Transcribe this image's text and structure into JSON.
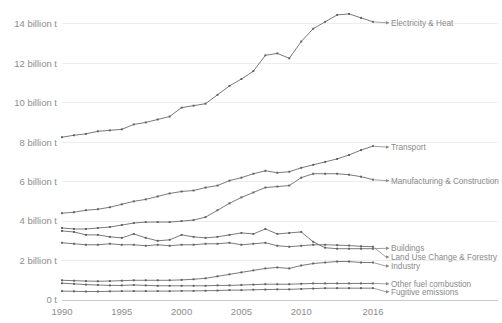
{
  "chart_data": {
    "type": "line",
    "title": "",
    "subtitle": "",
    "xlabel": "",
    "ylabel": "",
    "xlim": [
      1990,
      2016
    ],
    "ylim": [
      0,
      14.8
    ],
    "grid": true,
    "legend_position": "right-inline-labels",
    "x": [
      1990,
      1991,
      1992,
      1993,
      1994,
      1995,
      1996,
      1997,
      1998,
      1999,
      2000,
      2001,
      2002,
      2003,
      2004,
      2005,
      2006,
      2007,
      2008,
      2009,
      2010,
      2011,
      2012,
      2013,
      2014,
      2015,
      2016
    ],
    "xtick_labels": [
      "1990",
      "1995",
      "2000",
      "2005",
      "2010",
      "2016"
    ],
    "xtick_values": [
      1990,
      1995,
      2000,
      2005,
      2010,
      2016
    ],
    "ytick_labels": [
      "0 t",
      "2 billion t",
      "4 billion t",
      "6 billion t",
      "8 billion t",
      "10 billion t",
      "12 billion t",
      "14 billion t"
    ],
    "ytick_values": [
      0,
      2,
      4,
      6,
      8,
      10,
      12,
      14
    ],
    "units": "billion tonnes CO2e",
    "series": [
      {
        "name": "Electricity & Heat",
        "values": [
          8.25,
          8.35,
          8.42,
          8.55,
          8.6,
          8.65,
          8.9,
          9.0,
          9.15,
          9.3,
          9.75,
          9.85,
          9.95,
          10.4,
          10.85,
          11.2,
          11.6,
          12.4,
          12.5,
          12.25,
          13.1,
          13.75,
          14.1,
          14.45,
          14.5,
          14.3,
          14.1
        ]
      },
      {
        "name": "Transport",
        "values": [
          4.4,
          4.45,
          4.55,
          4.6,
          4.7,
          4.85,
          5.0,
          5.1,
          5.25,
          5.4,
          5.5,
          5.55,
          5.7,
          5.8,
          6.05,
          6.2,
          6.4,
          6.55,
          6.45,
          6.5,
          6.7,
          6.85,
          7.0,
          7.15,
          7.35,
          7.6,
          7.8
        ]
      },
      {
        "name": "Manufacturing & Construction",
        "values": [
          3.65,
          3.6,
          3.6,
          3.65,
          3.7,
          3.8,
          3.9,
          3.95,
          3.95,
          3.95,
          4.0,
          4.05,
          4.2,
          4.55,
          4.9,
          5.2,
          5.45,
          5.7,
          5.75,
          5.8,
          6.2,
          6.4,
          6.4,
          6.4,
          6.35,
          6.25,
          6.1
        ]
      },
      {
        "name": "Buildings",
        "values": [
          3.5,
          3.45,
          3.3,
          3.3,
          3.2,
          3.15,
          3.35,
          3.15,
          3.0,
          3.05,
          3.3,
          3.2,
          3.15,
          3.2,
          3.3,
          3.4,
          3.35,
          3.6,
          3.35,
          3.4,
          3.45,
          2.95,
          2.65,
          2.6,
          2.6,
          2.6,
          2.6
        ]
      },
      {
        "name": "Land Use Change & Forestry",
        "values": [
          2.9,
          2.85,
          2.8,
          2.8,
          2.85,
          2.8,
          2.8,
          2.75,
          2.8,
          2.75,
          2.8,
          2.8,
          2.85,
          2.85,
          2.9,
          2.8,
          2.85,
          2.9,
          2.75,
          2.7,
          2.75,
          2.8,
          2.8,
          2.78,
          2.76,
          2.72,
          2.7
        ]
      },
      {
        "name": "Industry",
        "values": [
          1.0,
          0.98,
          0.96,
          0.95,
          0.96,
          0.98,
          1.0,
          1.0,
          1.0,
          1.0,
          1.02,
          1.05,
          1.1,
          1.2,
          1.3,
          1.4,
          1.5,
          1.6,
          1.65,
          1.6,
          1.75,
          1.85,
          1.9,
          1.95,
          1.95,
          1.9,
          1.9
        ]
      },
      {
        "name": "Other fuel combustion",
        "values": [
          0.85,
          0.82,
          0.78,
          0.76,
          0.74,
          0.74,
          0.76,
          0.74,
          0.72,
          0.72,
          0.72,
          0.72,
          0.72,
          0.74,
          0.74,
          0.76,
          0.78,
          0.8,
          0.8,
          0.8,
          0.82,
          0.84,
          0.84,
          0.84,
          0.84,
          0.84,
          0.84
        ]
      },
      {
        "name": "Fugitive emissions",
        "values": [
          0.45,
          0.44,
          0.43,
          0.43,
          0.44,
          0.45,
          0.45,
          0.45,
          0.45,
          0.45,
          0.46,
          0.46,
          0.47,
          0.48,
          0.5,
          0.5,
          0.52,
          0.53,
          0.54,
          0.54,
          0.56,
          0.58,
          0.6,
          0.6,
          0.6,
          0.6,
          0.6
        ]
      }
    ],
    "series_label_positions": [
      {
        "name": "Electricity & Heat",
        "label_y": 14.05
      },
      {
        "name": "Transport",
        "label_y": 7.75
      },
      {
        "name": "Manufacturing & Construction",
        "label_y": 6.05
      },
      {
        "name": "Buildings",
        "label_y": 2.62
      },
      {
        "name": "Land Use Change & Forestry",
        "label_y": 2.18
      },
      {
        "name": "Industry",
        "label_y": 1.72
      },
      {
        "name": "Other fuel combustion",
        "label_y": 0.82
      },
      {
        "name": "Fugitive emissions",
        "label_y": 0.42
      }
    ],
    "colors": {
      "line": "#6b6b6b",
      "grid": "#ededed",
      "axis": "#c9c9c9",
      "text": "#8d8d8d",
      "background": "#ffffff"
    }
  }
}
